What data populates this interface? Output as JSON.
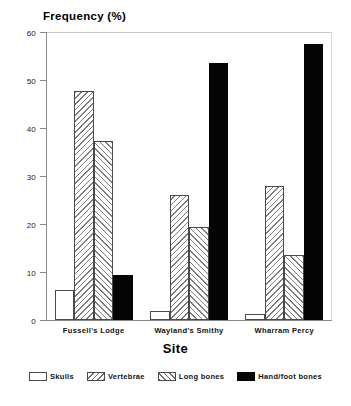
{
  "chart_data": {
    "type": "bar",
    "title": "",
    "ylabel": "Frequency (%)",
    "xlabel": "Site",
    "categories": [
      "Fussell's Lodge",
      "Wayland's Smithy",
      "Wharram Percy"
    ],
    "series": [
      {
        "name": "Skulls",
        "values": [
          6.2,
          1.8,
          1.3
        ]
      },
      {
        "name": "Vertebrae",
        "values": [
          47.8,
          26.0,
          28.0
        ]
      },
      {
        "name": "Long bones",
        "values": [
          37.2,
          19.4,
          13.6
        ]
      },
      {
        "name": "Hand/foot bones",
        "values": [
          9.3,
          53.5,
          57.5
        ]
      }
    ],
    "ylim": [
      0,
      60
    ],
    "yticks": [
      0,
      10,
      20,
      30,
      40,
      50,
      60
    ],
    "ytick_labels": [
      "0",
      "10",
      "20",
      "30",
      "40",
      "50",
      "60"
    ],
    "grid": false,
    "legend_position": "bottom",
    "colors": {
      "skulls": "#ffffff",
      "vertebrae": "#ffffff",
      "long_bones": "#ffffff",
      "hand_foot_bones": "#050505",
      "outline": "#4a4a4a",
      "hatch": "#7d7d7d",
      "axis": "#8a8a8a",
      "frame": "#c9c9c9",
      "background": "#ffffff",
      "text": "#111111"
    },
    "patterns": {
      "skulls": "solid-white",
      "vertebrae": "backslash-hatch",
      "long_bones": "forwardslash-hatch",
      "hand_foot_bones": "solid-black"
    }
  },
  "legend": {
    "items": [
      {
        "label": "Skulls",
        "pattern": "skulls"
      },
      {
        "label": "Vertebrae",
        "pattern": "vertebrae"
      },
      {
        "label": "Long bones",
        "pattern": "longbones"
      },
      {
        "label": "Hand/foot bones",
        "pattern": "handfoot"
      }
    ]
  }
}
